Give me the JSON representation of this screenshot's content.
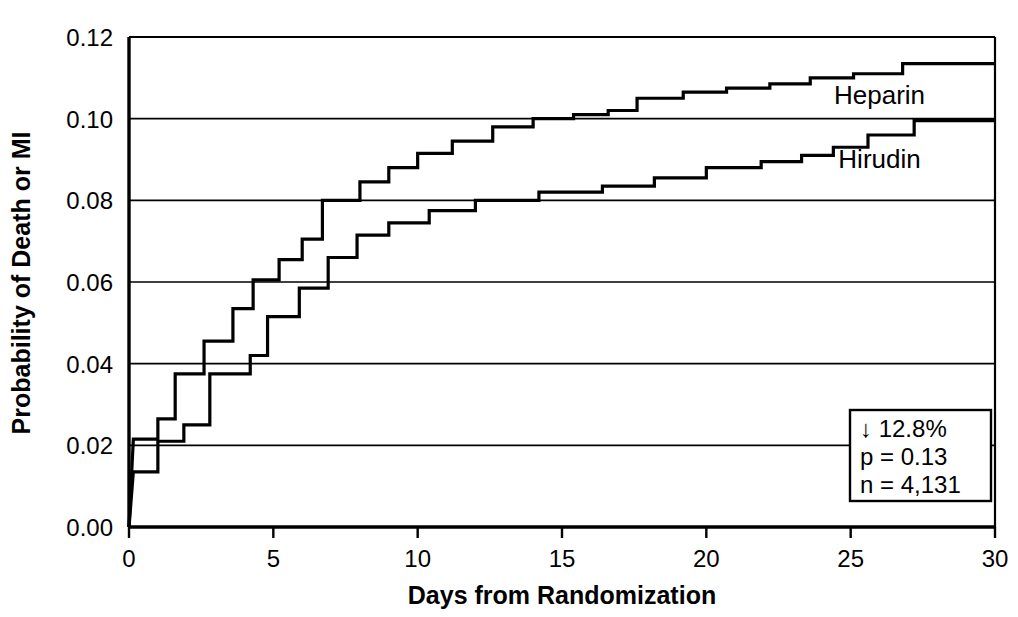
{
  "chart_data": {
    "type": "line",
    "subtype": "kaplan-meier step curves",
    "title": "",
    "xlabel": "Days from Randomization",
    "ylabel": "Probability of Death or MI",
    "xlim": [
      0,
      30
    ],
    "ylim": [
      0.0,
      0.12
    ],
    "xticks": [
      0,
      5,
      10,
      15,
      20,
      25,
      30
    ],
    "xtick_labels": [
      "0",
      "5",
      "10",
      "15",
      "20",
      "25",
      "30"
    ],
    "yticks": [
      0.0,
      0.02,
      0.04,
      0.06,
      0.08,
      0.1,
      0.12
    ],
    "ytick_labels": [
      "0.00",
      "0.02",
      "0.04",
      "0.06",
      "0.08",
      "0.10",
      "0.12"
    ],
    "grid": "horizontal",
    "grid_color": "#000000",
    "legend_position": "inline-right",
    "series": [
      {
        "name": "Heparin",
        "color": "#000000",
        "label_x": 26.0,
        "label_y": 0.1035,
        "final_value": 0.114,
        "points": [
          [
            0.0,
            0.0
          ],
          [
            0.15,
            0.0215
          ],
          [
            1.0,
            0.0215
          ],
          [
            1.0,
            0.0265
          ],
          [
            1.6,
            0.0265
          ],
          [
            1.6,
            0.0375
          ],
          [
            2.6,
            0.0375
          ],
          [
            2.6,
            0.0455
          ],
          [
            3.6,
            0.0455
          ],
          [
            3.6,
            0.0535
          ],
          [
            4.3,
            0.0535
          ],
          [
            4.3,
            0.0605
          ],
          [
            5.2,
            0.0605
          ],
          [
            5.2,
            0.0655
          ],
          [
            6.0,
            0.0655
          ],
          [
            6.0,
            0.0705
          ],
          [
            6.7,
            0.0705
          ],
          [
            6.7,
            0.08
          ],
          [
            8.0,
            0.08
          ],
          [
            8.0,
            0.0845
          ],
          [
            9.0,
            0.0845
          ],
          [
            9.0,
            0.088
          ],
          [
            10.0,
            0.088
          ],
          [
            10.0,
            0.0915
          ],
          [
            11.2,
            0.0915
          ],
          [
            11.2,
            0.0945
          ],
          [
            12.6,
            0.0945
          ],
          [
            12.6,
            0.098
          ],
          [
            14.0,
            0.098
          ],
          [
            14.0,
            0.1
          ],
          [
            15.4,
            0.1
          ],
          [
            15.4,
            0.101
          ],
          [
            16.6,
            0.101
          ],
          [
            16.6,
            0.102
          ],
          [
            17.6,
            0.102
          ],
          [
            17.6,
            0.105
          ],
          [
            19.2,
            0.105
          ],
          [
            19.2,
            0.1065
          ],
          [
            20.7,
            0.1065
          ],
          [
            20.7,
            0.1075
          ],
          [
            22.2,
            0.1075
          ],
          [
            22.2,
            0.1085
          ],
          [
            23.6,
            0.1085
          ],
          [
            23.6,
            0.11
          ],
          [
            25.1,
            0.11
          ],
          [
            25.1,
            0.111
          ],
          [
            26.8,
            0.111
          ],
          [
            26.8,
            0.1135
          ],
          [
            30.0,
            0.1135
          ]
        ]
      },
      {
        "name": "Hirudin",
        "color": "#000000",
        "label_x": 26.0,
        "label_y": 0.088,
        "final_value": 0.0995,
        "points": [
          [
            0.0,
            0.0
          ],
          [
            0.15,
            0.0135
          ],
          [
            1.0,
            0.0135
          ],
          [
            1.0,
            0.021
          ],
          [
            1.9,
            0.021
          ],
          [
            1.9,
            0.025
          ],
          [
            2.8,
            0.025
          ],
          [
            2.8,
            0.0375
          ],
          [
            4.2,
            0.0375
          ],
          [
            4.2,
            0.042
          ],
          [
            4.8,
            0.042
          ],
          [
            4.8,
            0.0515
          ],
          [
            5.9,
            0.0515
          ],
          [
            5.9,
            0.0585
          ],
          [
            6.9,
            0.0585
          ],
          [
            6.9,
            0.066
          ],
          [
            7.9,
            0.066
          ],
          [
            7.9,
            0.0715
          ],
          [
            9.0,
            0.0715
          ],
          [
            9.0,
            0.0745
          ],
          [
            10.4,
            0.0745
          ],
          [
            10.4,
            0.0775
          ],
          [
            12.0,
            0.0775
          ],
          [
            12.0,
            0.08
          ],
          [
            14.2,
            0.08
          ],
          [
            14.2,
            0.082
          ],
          [
            16.4,
            0.082
          ],
          [
            16.4,
            0.0835
          ],
          [
            18.2,
            0.0835
          ],
          [
            18.2,
            0.0855
          ],
          [
            20.0,
            0.0855
          ],
          [
            20.0,
            0.088
          ],
          [
            21.9,
            0.088
          ],
          [
            21.9,
            0.0895
          ],
          [
            23.3,
            0.0895
          ],
          [
            23.3,
            0.091
          ],
          [
            24.4,
            0.091
          ],
          [
            24.4,
            0.093
          ],
          [
            25.6,
            0.093
          ],
          [
            25.6,
            0.096
          ],
          [
            27.2,
            0.096
          ],
          [
            27.2,
            0.0995
          ],
          [
            30.0,
            0.0995
          ]
        ]
      }
    ],
    "annotation": {
      "lines": [
        "↓ 12.8%",
        "p = 0.13",
        "n = 4,131"
      ],
      "reduction": "12.8%",
      "p_value": "0.13",
      "n": "4,131",
      "box_x": 22.0,
      "box_y": 0.0
    }
  }
}
